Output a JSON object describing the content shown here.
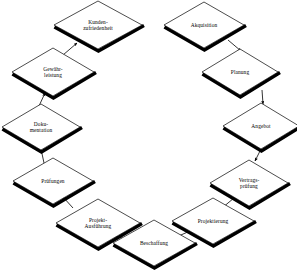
{
  "diagram": {
    "type": "cycle-flowchart",
    "shape": "diamond",
    "direction": "clockwise",
    "colors": {
      "background": "#ffffff",
      "node_fill": "#ffffff",
      "node_stroke": "#000000",
      "shadow": "#000000",
      "arrow": "#000000",
      "text": "#000000"
    },
    "nodes": [
      {
        "id": "kundenzufriedenheit",
        "label": "Kunden-\nzufriedenheit",
        "cx": 98,
        "cy": 25,
        "rx": 44,
        "ry": 24
      },
      {
        "id": "akquisition",
        "label": "Akquisition",
        "cx": 204,
        "cy": 25,
        "rx": 40,
        "ry": 23
      },
      {
        "id": "planung",
        "label": "Planung",
        "cx": 240,
        "cy": 72,
        "rx": 38,
        "ry": 23
      },
      {
        "id": "angebot",
        "label": "Angebot",
        "cx": 261,
        "cy": 126,
        "rx": 38,
        "ry": 23
      },
      {
        "id": "vertragspruefung",
        "label": "Vertrags-\nprüfung",
        "cx": 249,
        "cy": 183,
        "rx": 39,
        "ry": 23
      },
      {
        "id": "projektierung",
        "label": "Projektierung",
        "cx": 213,
        "cy": 221,
        "rx": 41,
        "ry": 23
      },
      {
        "id": "beschaffung",
        "label": "Beschaffung",
        "cx": 154,
        "cy": 243,
        "rx": 41,
        "ry": 23
      },
      {
        "id": "projektausfuehrung",
        "label": "Projekt-\nAusführung",
        "cx": 98,
        "cy": 223,
        "rx": 42,
        "ry": 24
      },
      {
        "id": "pruefungen",
        "label": "Prüfungen",
        "cx": 53,
        "cy": 181,
        "rx": 40,
        "ry": 23
      },
      {
        "id": "dokumentation",
        "label": "Doku-\nmentation",
        "cx": 41,
        "cy": 127,
        "rx": 39,
        "ry": 23
      },
      {
        "id": "gewaehrleistung",
        "label": "Gewähr-\nleistung",
        "cx": 53,
        "cy": 72,
        "rx": 41,
        "ry": 24
      }
    ],
    "edges": [
      {
        "from": "akquisition",
        "to": "planung",
        "x1": 228,
        "y1": 40,
        "x2": 241,
        "y2": 51
      },
      {
        "from": "planung",
        "to": "angebot",
        "x1": 262,
        "y1": 90,
        "x2": 263,
        "y2": 104
      },
      {
        "from": "angebot",
        "to": "vertragspruefung",
        "x1": 262,
        "y1": 147,
        "x2": 255,
        "y2": 161
      },
      {
        "from": "vertragspruefung",
        "to": "projektierung",
        "x1": 234,
        "y1": 198,
        "x2": 222,
        "y2": 208
      },
      {
        "from": "projektierung",
        "to": "beschaffung",
        "x1": 190,
        "y1": 231,
        "x2": 174,
        "y2": 238
      },
      {
        "from": "beschaffung",
        "to": "projektausfuehrung",
        "x1": 128,
        "y1": 240,
        "x2": 112,
        "y2": 235
      },
      {
        "from": "projektausfuehrung",
        "to": "pruefungen",
        "x1": 73,
        "y1": 208,
        "x2": 63,
        "y2": 197
      },
      {
        "from": "pruefungen",
        "to": "dokumentation",
        "x1": 44,
        "y1": 163,
        "x2": 41,
        "y2": 149
      },
      {
        "from": "dokumentation",
        "to": "gewaehrleistung",
        "x1": 39,
        "y1": 106,
        "x2": 45,
        "y2": 93
      },
      {
        "from": "gewaehrleistung",
        "to": "kundenzufriedenheit",
        "x1": 63,
        "y1": 55,
        "x2": 77,
        "y2": 43
      }
    ]
  }
}
